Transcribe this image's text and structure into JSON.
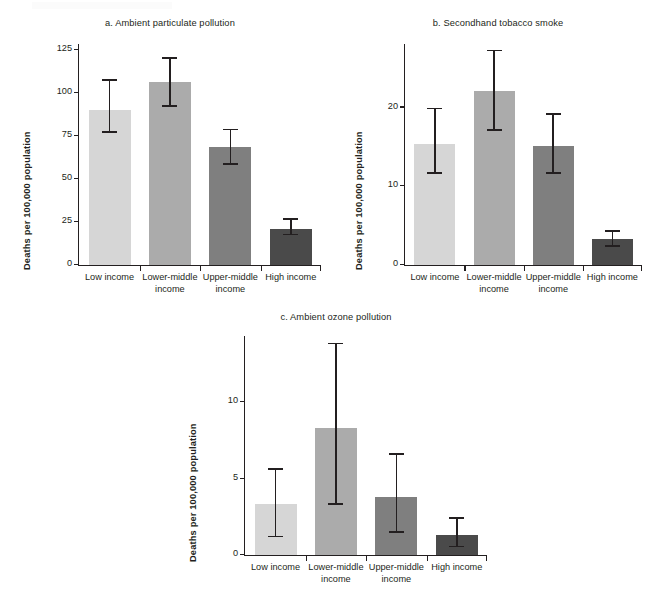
{
  "figure": {
    "background": "#ffffff",
    "axis_color": "#231f20",
    "palette": [
      "#d6d6d6",
      "#ababab",
      "#7f7f7f",
      "#4a4a4a"
    ]
  },
  "chart_data": [
    {
      "id": "a",
      "type": "bar",
      "title": "a. Ambient particulate pollution",
      "xlabel": "",
      "ylabel": "Deaths per 100,000 population",
      "categories": [
        "Low income",
        "Lower-middle income",
        "Upper-middle income",
        "High income"
      ],
      "category_lines": [
        [
          "Low income"
        ],
        [
          "Lower-middle",
          "income"
        ],
        [
          "Upper-middle",
          "income"
        ],
        [
          "High income"
        ]
      ],
      "values": [
        90,
        106,
        68.5,
        21
      ],
      "errors_low": [
        77,
        92,
        58.5,
        17.5
      ],
      "errors_high": [
        107,
        120,
        78.5,
        26.5
      ],
      "ylim": [
        0,
        128
      ],
      "yticks": [
        0,
        25,
        50,
        75,
        100,
        125
      ],
      "ytick_labels": [
        "0",
        "25",
        "50",
        "75",
        "100",
        "125"
      ],
      "grid": false,
      "legend": "none",
      "bar_colors": [
        "#d6d6d6",
        "#ababab",
        "#7f7f7f",
        "#4a4a4a"
      ]
    },
    {
      "id": "b",
      "type": "bar",
      "title": "b. Secondhand tobacco smoke",
      "xlabel": "",
      "ylabel": "Deaths per 100,000 population",
      "categories": [
        "Low income",
        "Lower-middle income",
        "Upper-middle income",
        "High income"
      ],
      "category_lines": [
        [
          "Low income"
        ],
        [
          "Lower-middle",
          "income"
        ],
        [
          "Upper-middle",
          "income"
        ],
        [
          "High income"
        ]
      ],
      "values": [
        15.3,
        22.0,
        15.1,
        3.2
      ],
      "errors_low": [
        11.6,
        17.1,
        11.6,
        2.4
      ],
      "errors_high": [
        19.8,
        27.2,
        19.1,
        4.3
      ],
      "ylim": [
        0,
        28
      ],
      "yticks": [
        0,
        10,
        20
      ],
      "ytick_labels": [
        "0",
        "10",
        "20"
      ],
      "grid": false,
      "legend": "none",
      "bar_colors": [
        "#d6d6d6",
        "#ababab",
        "#7f7f7f",
        "#4a4a4a"
      ]
    },
    {
      "id": "c",
      "type": "bar",
      "title": "c. Ambient ozone pollution",
      "xlabel": "",
      "ylabel": "Deaths per 100,000 population",
      "categories": [
        "Low income",
        "Lower-middle income",
        "Upper-middle income",
        "High income"
      ],
      "category_lines": [
        [
          "Low income"
        ],
        [
          "Lower-middle",
          "income"
        ],
        [
          "Upper-middle",
          "income"
        ],
        [
          "High income"
        ]
      ],
      "values": [
        3.3,
        8.3,
        3.8,
        1.3
      ],
      "errors_low": [
        1.2,
        3.3,
        1.5,
        0.55
      ],
      "errors_high": [
        5.6,
        13.8,
        6.6,
        2.4
      ],
      "ylim": [
        0,
        14.3
      ],
      "yticks": [
        0,
        5,
        10
      ],
      "ytick_labels": [
        "0",
        "5",
        "10"
      ],
      "grid": false,
      "legend": "none",
      "bar_colors": [
        "#d6d6d6",
        "#ababab",
        "#7f7f7f",
        "#4a4a4a"
      ]
    }
  ]
}
